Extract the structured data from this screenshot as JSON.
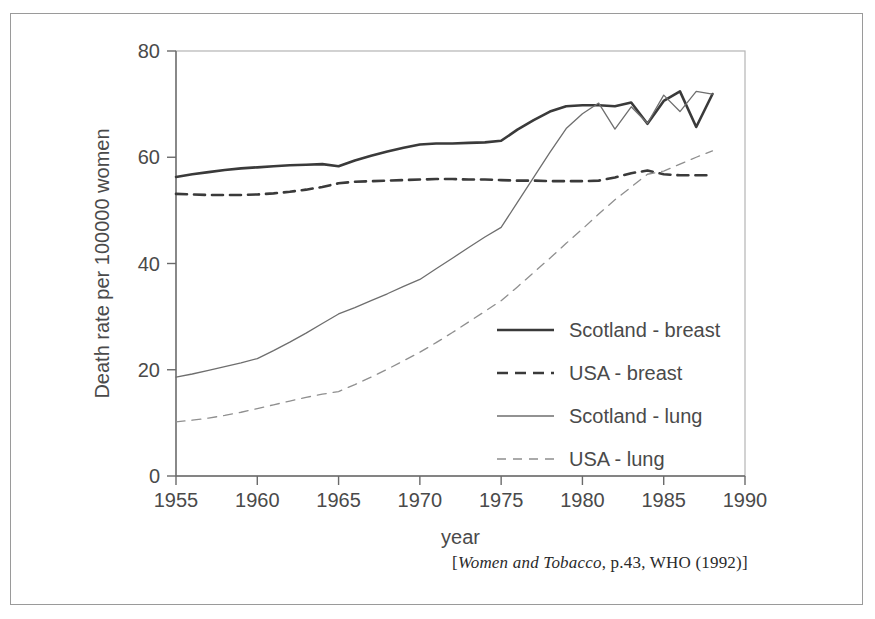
{
  "chart_data": {
    "type": "line",
    "title": "",
    "xlabel": "year",
    "ylabel": "Death rate per 100000 women",
    "xlim": [
      1955,
      1990
    ],
    "ylim": [
      0,
      80
    ],
    "xticks": [
      "1955",
      "1960",
      "1965",
      "1970",
      "1975",
      "1980",
      "1985",
      "1990"
    ],
    "yticks": [
      "0",
      "20",
      "40",
      "60",
      "80"
    ],
    "grid": false,
    "legend_position": "center-right",
    "series": [
      {
        "name": "Scotland - breast",
        "style": "solid",
        "weight": "thick",
        "color": "#3a3a3a",
        "x": [
          1955,
          1956,
          1957,
          1958,
          1959,
          1960,
          1961,
          1962,
          1963,
          1964,
          1965,
          1966,
          1967,
          1968,
          1969,
          1970,
          1971,
          1972,
          1973,
          1974,
          1975,
          1976,
          1977,
          1978,
          1979,
          1980,
          1981,
          1982,
          1983,
          1984,
          1985,
          1986,
          1987,
          1988
        ],
        "values": [
          56.3,
          56.8,
          57.2,
          57.6,
          57.9,
          58.1,
          58.3,
          58.5,
          58.6,
          58.7,
          58.3,
          59.4,
          60.3,
          61.1,
          61.8,
          62.4,
          62.6,
          62.6,
          62.7,
          62.8,
          63.1,
          65.2,
          67.0,
          68.6,
          69.6,
          69.8,
          69.8,
          69.6,
          70.3,
          66.3,
          70.6,
          72.4,
          65.7,
          71.9
        ]
      },
      {
        "name": "USA - breast",
        "style": "dashed",
        "weight": "thick",
        "color": "#3a3a3a",
        "x": [
          1955,
          1956,
          1957,
          1958,
          1959,
          1960,
          1961,
          1962,
          1963,
          1964,
          1965,
          1966,
          1967,
          1968,
          1969,
          1970,
          1971,
          1972,
          1973,
          1974,
          1975,
          1976,
          1977,
          1978,
          1979,
          1980,
          1981,
          1982,
          1983,
          1984,
          1985,
          1986,
          1987,
          1988
        ],
        "values": [
          53.1,
          53.0,
          52.9,
          52.9,
          52.9,
          53.0,
          53.2,
          53.5,
          53.9,
          54.4,
          55.1,
          55.4,
          55.5,
          55.6,
          55.7,
          55.8,
          55.9,
          55.9,
          55.8,
          55.8,
          55.7,
          55.6,
          55.6,
          55.5,
          55.5,
          55.5,
          55.6,
          56.2,
          57.0,
          57.5,
          56.8,
          56.6,
          56.6,
          56.6
        ]
      },
      {
        "name": "Scotland - lung",
        "style": "solid",
        "weight": "thin",
        "color": "#6e6e6e",
        "x": [
          1955,
          1956,
          1957,
          1958,
          1959,
          1960,
          1961,
          1962,
          1963,
          1964,
          1965,
          1966,
          1967,
          1968,
          1969,
          1970,
          1971,
          1972,
          1973,
          1974,
          1975,
          1976,
          1977,
          1978,
          1979,
          1980,
          1981,
          1982,
          1983,
          1984,
          1985,
          1986,
          1987,
          1988
        ],
        "values": [
          18.6,
          19.2,
          19.9,
          20.6,
          21.3,
          22.1,
          23.6,
          25.2,
          26.9,
          28.7,
          30.5,
          31.7,
          33.0,
          34.3,
          35.7,
          37.0,
          39.0,
          41.0,
          43.0,
          45.0,
          46.8,
          51.5,
          56.2,
          60.9,
          65.4,
          68.2,
          70.2,
          65.3,
          69.5,
          66.4,
          71.7,
          68.6,
          72.4,
          71.9
        ]
      },
      {
        "name": "USA - lung",
        "style": "dashed",
        "weight": "thin",
        "color": "#8f8f8f",
        "x": [
          1955,
          1956,
          1957,
          1958,
          1959,
          1960,
          1961,
          1962,
          1963,
          1964,
          1965,
          1966,
          1967,
          1968,
          1969,
          1970,
          1971,
          1972,
          1973,
          1974,
          1975,
          1976,
          1977,
          1978,
          1979,
          1980,
          1981,
          1982,
          1983,
          1984,
          1985,
          1986,
          1987,
          1988
        ],
        "values": [
          10.2,
          10.5,
          10.9,
          11.4,
          12.0,
          12.7,
          13.4,
          14.1,
          14.8,
          15.4,
          15.9,
          17.2,
          18.6,
          20.1,
          21.7,
          23.3,
          25.1,
          27.0,
          29.0,
          31.0,
          33.0,
          35.6,
          38.3,
          41.0,
          43.8,
          46.5,
          49.3,
          52.0,
          54.4,
          56.8,
          57.4,
          58.7,
          60.0,
          61.2
        ]
      }
    ]
  },
  "citation": {
    "open_bracket": "[",
    "italic_part": "Women and Tobacco",
    "rest": ", p.43, WHO (1992)",
    "close_bracket": "]"
  }
}
